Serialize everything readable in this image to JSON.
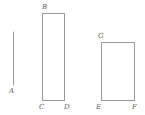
{
  "figure": {
    "background_color": "#ffffff",
    "stroke_color": "#9a9a9a",
    "label_color": "#5a5a5a",
    "canvas": {
      "width": 145,
      "height": 115
    },
    "segment": {
      "name": "segment-a",
      "x1": 13,
      "y1": 32,
      "x2": 13,
      "y2": 85,
      "label": "A",
      "label_x": 9,
      "label_y": 87
    },
    "rectangles": [
      {
        "name": "rectangle-bcd",
        "x": 42,
        "y": 13,
        "width": 22,
        "height": 87,
        "corner_labels": [
          {
            "name": "vertex-label-b",
            "label": "B",
            "x": 42,
            "y": 3
          },
          {
            "name": "vertex-label-c",
            "label": "C",
            "x": 39,
            "y": 103
          },
          {
            "name": "vertex-label-d",
            "label": "D",
            "x": 64,
            "y": 103
          }
        ]
      },
      {
        "name": "rectangle-gef",
        "x": 101,
        "y": 42,
        "width": 33,
        "height": 58,
        "corner_labels": [
          {
            "name": "vertex-label-g",
            "label": "G",
            "x": 98,
            "y": 32
          },
          {
            "name": "vertex-label-e",
            "label": "E",
            "x": 96,
            "y": 103
          },
          {
            "name": "vertex-label-f",
            "label": "F",
            "x": 132,
            "y": 103
          }
        ]
      }
    ],
    "all_labels": [
      "A",
      "B",
      "C",
      "D",
      "E",
      "F",
      "G"
    ]
  }
}
